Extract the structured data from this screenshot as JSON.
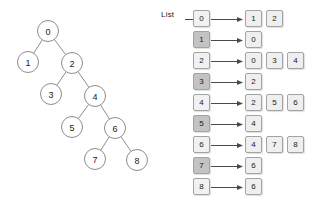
{
  "figure": {
    "title_visible": false,
    "colors": {
      "node_fill": "#ffffff",
      "node_stroke": "#8d8d8d",
      "box_light": "#f1f1f1",
      "box_dark": "#c3c3c3",
      "box_cell": "#efefef",
      "box_border": "#a3a3a3",
      "arrow": "#4a4a4a",
      "text": "#1a1a1a",
      "background": "#ffffff"
    }
  },
  "tree": {
    "name": "binary-tree-diagram",
    "nodes": [
      {
        "id": "0",
        "label": "0",
        "cx": 48,
        "cy": 31
      },
      {
        "id": "1",
        "label": "1",
        "cx": 28,
        "cy": 62
      },
      {
        "id": "2",
        "label": "2",
        "cx": 72,
        "cy": 63
      },
      {
        "id": "3",
        "label": "3",
        "cx": 51,
        "cy": 94
      },
      {
        "id": "4",
        "label": "4",
        "cx": 95,
        "cy": 96
      },
      {
        "id": "5",
        "label": "5",
        "cx": 72,
        "cy": 127
      },
      {
        "id": "6",
        "label": "6",
        "cx": 115,
        "cy": 128
      },
      {
        "id": "7",
        "label": "7",
        "cx": 95,
        "cy": 159
      },
      {
        "id": "8",
        "label": "8",
        "cx": 137,
        "cy": 160
      }
    ],
    "radius": 10.5,
    "edges": [
      {
        "from": "0",
        "to": "1"
      },
      {
        "from": "0",
        "to": "2"
      },
      {
        "from": "2",
        "to": "3"
      },
      {
        "from": "2",
        "to": "4"
      },
      {
        "from": "4",
        "to": "5"
      },
      {
        "from": "4",
        "to": "6"
      },
      {
        "from": "6",
        "to": "7"
      },
      {
        "from": "6",
        "to": "8"
      }
    ]
  },
  "adjacency_list": {
    "label": "List",
    "rows": [
      {
        "head": "0",
        "shade": "light",
        "cells": [
          "1",
          "2"
        ]
      },
      {
        "head": "1",
        "shade": "dark",
        "cells": [
          "0"
        ]
      },
      {
        "head": "2",
        "shade": "light",
        "cells": [
          "0",
          "3",
          "4"
        ]
      },
      {
        "head": "3",
        "shade": "dark",
        "cells": [
          "2"
        ]
      },
      {
        "head": "4",
        "shade": "light",
        "cells": [
          "2",
          "5",
          "6"
        ]
      },
      {
        "head": "5",
        "shade": "dark",
        "cells": [
          "4"
        ]
      },
      {
        "head": "6",
        "shade": "light",
        "cells": [
          "4",
          "7",
          "8"
        ]
      },
      {
        "head": "7",
        "shade": "dark",
        "cells": [
          "6"
        ]
      },
      {
        "head": "8",
        "shade": "light",
        "cells": [
          "6"
        ]
      }
    ],
    "row_top_start": 10,
    "row_pitch": 21,
    "cell_left_start": 85,
    "cell_pitch": 21
  }
}
